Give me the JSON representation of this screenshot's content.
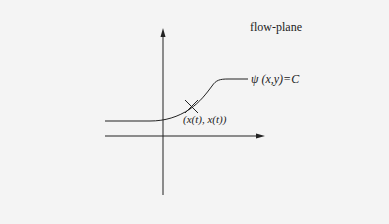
{
  "diagram": {
    "title": "flow-plane",
    "curve_label": "ψ (x,y)=C",
    "point_label": "(x(t), x(t))",
    "colors": {
      "background": "#f4f4f4",
      "ink": "#222222"
    },
    "elements": {
      "vertical_axis": "arrow pointing up",
      "horizontal_axis": "arrow pointing right",
      "curve": "sigmoid-like streamline curve",
      "point_marker": "X cross marker on curve"
    }
  }
}
